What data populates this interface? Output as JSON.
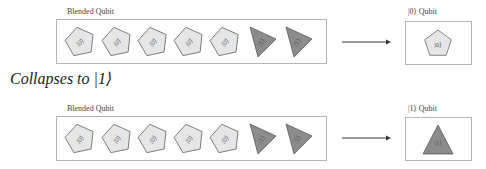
{
  "heading": "Collapses to |1⟩",
  "colors": {
    "pentagon_fill": "#e6e6e6",
    "pentagon_stroke": "#6a6a6a",
    "triangle_fill": "#8c8c8c",
    "triangle_stroke": "#5a5a5a",
    "box_border": "#b5b5b5",
    "arrow": "#333333"
  },
  "rows": [
    {
      "blend_label": "Blended Qubit",
      "result_label": "|0⟩ Qubit",
      "items": [
        {
          "shape": "pentagon",
          "ket": "|0⟩"
        },
        {
          "shape": "pentagon",
          "ket": "|0⟩"
        },
        {
          "shape": "pentagon",
          "ket": "|0⟩"
        },
        {
          "shape": "pentagon",
          "ket": "|0⟩"
        },
        {
          "shape": "pentagon",
          "ket": "|0⟩"
        },
        {
          "shape": "triangle",
          "ket": "|1⟩"
        },
        {
          "shape": "triangle",
          "ket": "|1⟩"
        }
      ],
      "result": {
        "shape": "pentagon",
        "ket": "|0⟩"
      }
    },
    {
      "blend_label": "Blended Qubit",
      "result_label": "|1⟩ Qubit",
      "items": [
        {
          "shape": "pentagon",
          "ket": "|0⟩"
        },
        {
          "shape": "pentagon",
          "ket": "|0⟩"
        },
        {
          "shape": "pentagon",
          "ket": "|0⟩"
        },
        {
          "shape": "pentagon",
          "ket": "|0⟩"
        },
        {
          "shape": "pentagon",
          "ket": "|0⟩"
        },
        {
          "shape": "triangle",
          "ket": "|1⟩"
        },
        {
          "shape": "triangle",
          "ket": "|1⟩"
        }
      ],
      "result": {
        "shape": "triangle",
        "ket": "|1⟩"
      }
    }
  ]
}
